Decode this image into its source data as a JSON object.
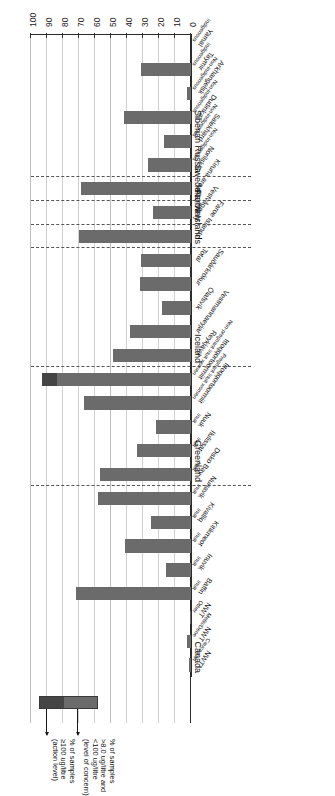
{
  "chart_data": {
    "type": "bar",
    "orientation": "horizontal",
    "stacked": true,
    "title": "",
    "xlabel": "",
    "ylabel": "",
    "xlim": [
      0,
      100
    ],
    "grid": true,
    "tick_labels": [
      "0",
      "10",
      "20",
      "30",
      "40",
      "50",
      "60",
      "70",
      "80",
      "90",
      "100"
    ],
    "tick_values": [
      0,
      10,
      20,
      30,
      40,
      50,
      60,
      70,
      80,
      90,
      100
    ],
    "legend_position": "top-right",
    "series": [
      {
        "name": "level_of_concern",
        "label_line1": "% of samples",
        "label_line2": ">8.0 ug/litre and",
        "label_line3": "<100 ug/litre",
        "label_line4": "(level of concern)",
        "color": "#6b6b6b"
      },
      {
        "name": "action_level",
        "label_line1": "% of samples",
        "label_line2": "≥100 ug/litre",
        "label_line3": "(action level)",
        "color": "#454545"
      }
    ],
    "groups": [
      {
        "name": "Canada",
        "categories": [
          {
            "label": "NWT",
            "sub": "Caucasian",
            "low": 1.0,
            "high": 0
          },
          {
            "label": "NWT",
            "sub": "Metis/Dene",
            "low": 2.8,
            "high": 0
          },
          {
            "label": "NWT",
            "sub": "Other",
            "low": 0.6,
            "high": 0
          },
          {
            "label": "Baffin",
            "sub": "Inuit",
            "low": 72.0,
            "high": 0
          },
          {
            "label": "Inuvik",
            "sub": "Inuit",
            "low": 15.5,
            "high": 0
          },
          {
            "label": "Kitikmeot",
            "sub": "Inuit",
            "low": 41.0,
            "high": 0
          },
          {
            "label": "Kivalliq",
            "sub": "Inuit",
            "low": 25.0,
            "high": 0
          },
          {
            "label": "Nunavik",
            "sub": "Inuit",
            "low": 58.0,
            "high": 0
          }
        ]
      },
      {
        "name": "Greenland",
        "categories": [
          {
            "label": "Disko Bay",
            "sub": "Inuit",
            "low": 57.0,
            "high": 0
          },
          {
            "label": "Ilulissat",
            "sub": "Inuit",
            "low": 34.0,
            "high": 0
          },
          {
            "label": "Nuuk",
            "sub": "Inuit",
            "low": 22.0,
            "high": 0
          },
          {
            "label": "Ittoqqortoormiit",
            "sub": "Pregnant Inuit women",
            "low": 67.0,
            "high": 0
          },
          {
            "label": "Ittoqqortoormiit",
            "sub": "Non-pregnant Inuit women",
            "low": 84.0,
            "high": 9.0
          }
        ]
      },
      {
        "name": "Iceland",
        "categories": [
          {
            "label": "Reykjavik",
            "sub": "",
            "low": 49.0,
            "high": 0
          },
          {
            "label": "Vestmannaeyjar",
            "sub": "",
            "low": 38.0,
            "high": 0
          },
          {
            "label": "Ólafsvík",
            "sub": "",
            "low": 18.0,
            "high": 0
          },
          {
            "label": "Sauðárkrókur",
            "sub": "",
            "low": 32.0,
            "high": 0
          },
          {
            "label": "Total",
            "sub": "",
            "low": 31.0,
            "high": 0
          }
        ]
      },
      {
        "name": "Faroe Islands",
        "categories": [
          {
            "label": "Faroe Islands",
            "sub": "",
            "low": 70.0,
            "high": 0
          }
        ]
      },
      {
        "name": "Norway",
        "categories": [
          {
            "label": "Vestvågøy",
            "sub": "",
            "low": 24.0,
            "high": 0
          }
        ]
      },
      {
        "name": "Sweden",
        "categories": [
          {
            "label": "Kiruna area",
            "sub": "",
            "low": 69.0,
            "high": 0
          }
        ]
      },
      {
        "name": "Siberian Russia",
        "categories": [
          {
            "label": "Norilsk",
            "sub": "Non-indigenous",
            "low": 27.0,
            "high": 0
          },
          {
            "label": "Salekhard",
            "sub": "Non-indigenous",
            "low": 17.0,
            "high": 0
          },
          {
            "label": "Dudinka",
            "sub": "Non-indigenous",
            "low": 42.0,
            "high": 0
          },
          {
            "label": "Arkhangelsk",
            "sub": "Non-indigenous",
            "low": 2.5,
            "high": 0
          },
          {
            "label": "Taymir",
            "sub": "Indigenous",
            "low": 31.0,
            "high": 0
          },
          {
            "label": "Yamal",
            "sub": "Indigenous",
            "low": 0.0,
            "high": 0
          }
        ]
      }
    ]
  }
}
